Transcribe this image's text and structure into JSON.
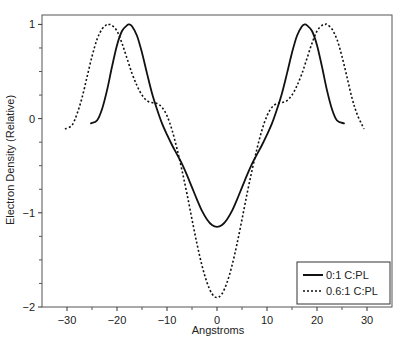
{
  "chart_data": {
    "type": "line",
    "title": "",
    "xlabel": "Angstroms",
    "ylabel": "Electron Density (Relative)",
    "xlim": [
      -35,
      35
    ],
    "ylim": [
      -2,
      1.1
    ],
    "xticks": [
      -30,
      -20,
      -10,
      0,
      10,
      20,
      30
    ],
    "xtick_labels": [
      "−30",
      "−20",
      "−10",
      "0",
      "10",
      "20",
      "30"
    ],
    "xminor_ticks": [
      -25,
      -15,
      -5,
      5,
      15,
      25
    ],
    "yticks": [
      1,
      0,
      -1,
      -2
    ],
    "ytick_labels": [
      "1",
      "0",
      "−1",
      "−2"
    ],
    "yminor_ticks": [
      0.75,
      0.5,
      0.25,
      -0.25,
      -0.5,
      -0.75,
      -1.25,
      -1.5,
      -1.75
    ],
    "grid": false,
    "legend_position": "lower right",
    "series": [
      {
        "name": "0:1 C:PL",
        "style": "solid",
        "color": "#111111",
        "x": [
          -25.2,
          -24,
          -23,
          -22,
          -21,
          -20,
          -19,
          -18,
          -17.6,
          -17,
          -16,
          -15,
          -14,
          -13,
          -12,
          -11,
          -10,
          -9,
          -8,
          -7,
          -6,
          -5,
          -4,
          -3,
          -2,
          -1,
          0,
          1,
          2,
          3,
          4,
          5,
          6,
          7,
          8,
          9,
          10,
          11,
          12,
          13,
          14,
          15,
          16,
          17,
          17.6,
          18,
          19,
          20,
          21,
          22,
          23,
          24,
          25.4
        ],
        "y": [
          -0.05,
          -0.02,
          0.1,
          0.3,
          0.55,
          0.78,
          0.93,
          0.99,
          1.0,
          0.98,
          0.88,
          0.7,
          0.48,
          0.27,
          0.1,
          -0.05,
          -0.17,
          -0.28,
          -0.38,
          -0.48,
          -0.6,
          -0.73,
          -0.86,
          -0.98,
          -1.07,
          -1.13,
          -1.15,
          -1.13,
          -1.07,
          -0.98,
          -0.86,
          -0.73,
          -0.6,
          -0.48,
          -0.38,
          -0.28,
          -0.17,
          -0.05,
          0.1,
          0.27,
          0.48,
          0.7,
          0.88,
          0.98,
          1.0,
          0.99,
          0.93,
          0.78,
          0.55,
          0.3,
          0.1,
          -0.02,
          -0.05
        ]
      },
      {
        "name": "0.6:1 C:PL",
        "style": "dotted",
        "color": "#111111",
        "x": [
          -30.4,
          -29,
          -28,
          -27,
          -26,
          -25,
          -24,
          -23,
          -22,
          -21.6,
          -21,
          -20,
          -19,
          -18,
          -17,
          -16,
          -15,
          -14,
          -13,
          -12,
          -11,
          -10,
          -9,
          -8,
          -7,
          -6,
          -5,
          -4,
          -3,
          -2,
          -1,
          0,
          1,
          2,
          3,
          4,
          5,
          6,
          7,
          8,
          9,
          10,
          11,
          12,
          13,
          14,
          15,
          16,
          17,
          18,
          19,
          20,
          21,
          21.6,
          22,
          23,
          24,
          25,
          26,
          27,
          28,
          29.4
        ],
        "y": [
          -0.11,
          -0.07,
          0.05,
          0.22,
          0.44,
          0.66,
          0.84,
          0.95,
          1.0,
          1.0,
          0.99,
          0.93,
          0.8,
          0.64,
          0.48,
          0.35,
          0.25,
          0.19,
          0.17,
          0.16,
          0.12,
          0.03,
          -0.12,
          -0.32,
          -0.55,
          -0.8,
          -1.07,
          -1.33,
          -1.56,
          -1.74,
          -1.86,
          -1.9,
          -1.86,
          -1.74,
          -1.56,
          -1.33,
          -1.07,
          -0.8,
          -0.55,
          -0.32,
          -0.12,
          0.03,
          0.12,
          0.16,
          0.17,
          0.19,
          0.25,
          0.35,
          0.48,
          0.64,
          0.8,
          0.93,
          0.99,
          1.0,
          1.0,
          0.95,
          0.84,
          0.66,
          0.44,
          0.22,
          0.05,
          -0.11
        ]
      }
    ]
  },
  "legend": {
    "items": [
      {
        "label": "0:1 C:PL",
        "style": "solid"
      },
      {
        "label": "0.6:1 C:PL",
        "style": "dotted"
      }
    ]
  }
}
